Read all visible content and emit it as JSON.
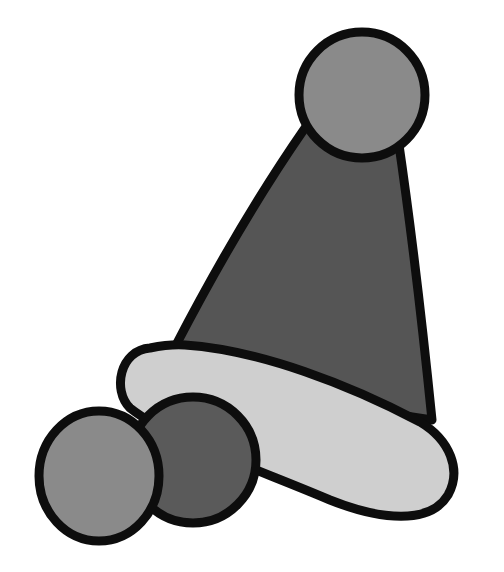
{
  "illustration": {
    "subject": "party hat with pom-poms",
    "colors": {
      "background": "#ffffff",
      "outline": "#0d0d0d",
      "cone": "#555555",
      "top_pompom": "#8a8a8a",
      "brim": "#cfcfcf",
      "front_pompom_left": "#8a8a8a",
      "front_pompom_right": "#5a5a5a"
    }
  }
}
